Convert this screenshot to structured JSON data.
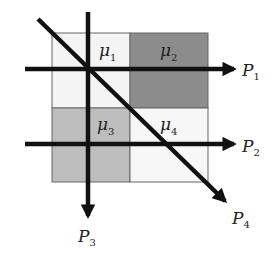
{
  "figure": {
    "cells": [
      {
        "id": "mu1",
        "symbol": "μ",
        "index": "1",
        "fill": "#f4f4f4"
      },
      {
        "id": "mu2",
        "symbol": "μ",
        "index": "2",
        "fill": "#8c8c8c"
      },
      {
        "id": "mu3",
        "symbol": "μ",
        "index": "3",
        "fill": "#bdbdbd"
      },
      {
        "id": "mu4",
        "symbol": "μ",
        "index": "4",
        "fill": "#f7f7f7"
      }
    ],
    "lines": [
      {
        "id": "P1",
        "symbol": "P",
        "index": "1",
        "orientation": "horizontal"
      },
      {
        "id": "P2",
        "symbol": "P",
        "index": "2",
        "orientation": "horizontal"
      },
      {
        "id": "P3",
        "symbol": "P",
        "index": "3",
        "orientation": "vertical"
      },
      {
        "id": "P4",
        "symbol": "P",
        "index": "4",
        "orientation": "diagonal"
      }
    ],
    "colors": {
      "line": "#111111",
      "grid_border": "#666666",
      "text": "#222222"
    }
  }
}
